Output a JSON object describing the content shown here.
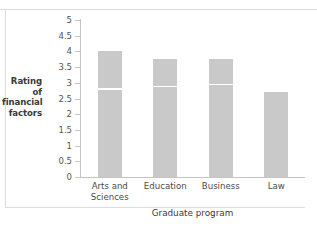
{
  "chart_data": {
    "type": "bar",
    "title": "",
    "xlabel": "Graduate program",
    "ylabel": "Rating of financial factors",
    "categories": [
      "Arts and Sciences",
      "Education",
      "Business",
      "Law"
    ],
    "values": [
      4.0,
      3.75,
      3.75,
      2.72
    ],
    "series": [
      {
        "name": "Rating of financial factors",
        "values": [
          4.0,
          3.75,
          3.75,
          2.72
        ]
      }
    ],
    "median_markers": {
      "description": "white horizontal rule inside each bar",
      "values": [
        2.83,
        2.9,
        2.97,
        null
      ]
    },
    "ylim": [
      0,
      5
    ],
    "ytick_labels": [
      "0",
      "0.5",
      "1",
      "1.5",
      "2",
      "2.5",
      "3",
      "3.5",
      "4",
      "4.5",
      "5"
    ],
    "ytick_values": [
      0,
      0.5,
      1,
      1.5,
      2,
      2.5,
      3,
      3.5,
      4,
      4.5,
      5
    ],
    "grid": false,
    "legend": null,
    "bar_color": "#c9c9c9",
    "axis_color": "#c4c4c4",
    "background_color": "#ffffff"
  },
  "ylabel_lines": [
    "Rating of",
    "financial",
    "factors"
  ],
  "xtick_lines": [
    [
      "Arts and",
      "Sciences"
    ],
    [
      "Education"
    ],
    [
      "Business"
    ],
    [
      "Law"
    ]
  ]
}
